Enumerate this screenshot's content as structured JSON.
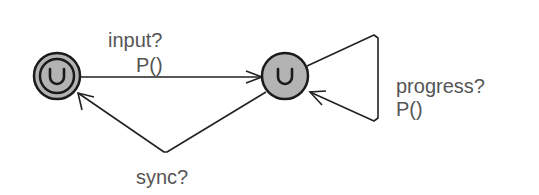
{
  "diagram": {
    "type": "timed-automaton",
    "colors": {
      "state_fill": "#b3b3b3",
      "stroke": "#1a1a1a",
      "label": "#555555"
    },
    "states": [
      {
        "id": "s0",
        "initial": true,
        "marker": "u-glyph"
      },
      {
        "id": "s1",
        "initial": false,
        "marker": "u-glyph"
      }
    ],
    "edges": [
      {
        "from": "s0",
        "to": "s1",
        "labels": [
          "input?",
          "P()"
        ]
      },
      {
        "from": "s1",
        "to": "s0",
        "labels": [
          "sync?"
        ]
      },
      {
        "from": "s1",
        "to": "s1",
        "labels": [
          "progress?",
          "P()"
        ]
      }
    ]
  }
}
